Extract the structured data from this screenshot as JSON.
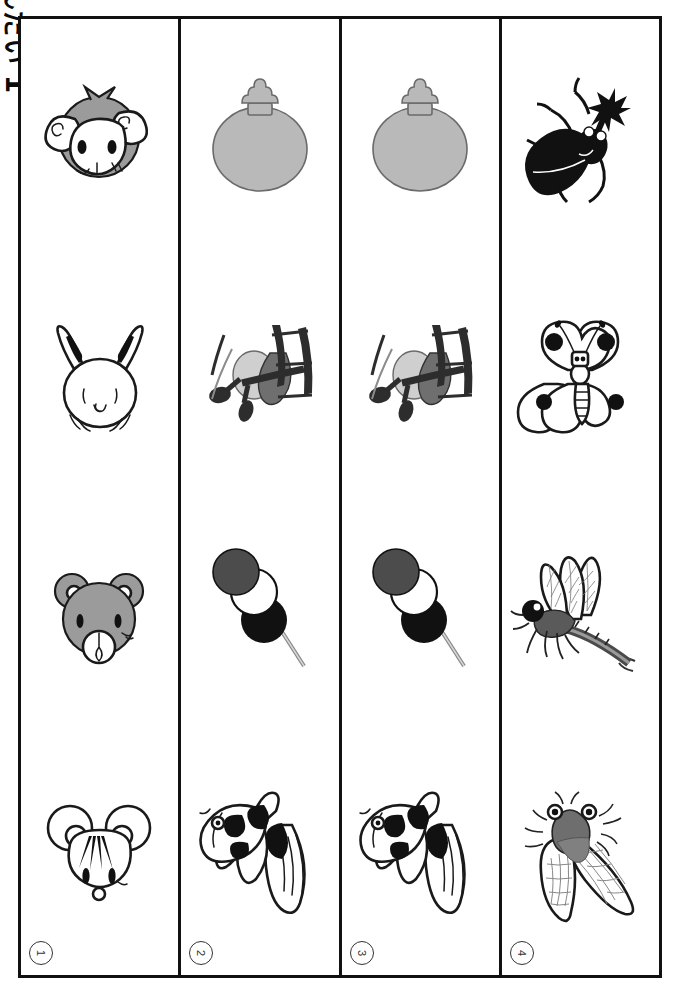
{
  "worksheet": {
    "title": "もんだい 1",
    "title_romaji": "mondai 1",
    "orientation": "rotated-90",
    "columns": 4,
    "rows": 4,
    "frame_color": "#111111",
    "background_color": "#ffffff"
  },
  "column_labels": [
    {
      "number": "1",
      "glyph": "①"
    },
    {
      "number": "2",
      "glyph": "②"
    },
    {
      "number": "3",
      "glyph": "③"
    },
    {
      "number": "4",
      "glyph": "④"
    }
  ],
  "grid": {
    "columns": [
      {
        "label": "①",
        "name": "column-1",
        "cells": [
          {
            "row": 1,
            "icon": "monkey-face-icon",
            "alt": "monkey face"
          },
          {
            "row": 2,
            "icon": "rabbit-face-icon",
            "alt": "rabbit face"
          },
          {
            "row": 3,
            "icon": "bear-face-icon",
            "alt": "bear face"
          },
          {
            "row": 4,
            "icon": "mouse-face-icon",
            "alt": "mouse face"
          }
        ]
      },
      {
        "label": "②",
        "name": "column-2",
        "cells": [
          {
            "row": 1,
            "icon": "uchiwa-fan-icon",
            "alt": "round paper fan"
          },
          {
            "row": 2,
            "icon": "biplane-icon",
            "alt": "biplane airplane"
          },
          {
            "row": 3,
            "icon": "dango-skewer-icon",
            "alt": "three dango on a skewer"
          },
          {
            "row": 4,
            "icon": "goldfish-icon",
            "alt": "goldfish"
          }
        ]
      },
      {
        "label": "③",
        "name": "column-3",
        "cells": [
          {
            "row": 1,
            "icon": "uchiwa-fan-icon",
            "alt": "round paper fan"
          },
          {
            "row": 2,
            "icon": "biplane-icon",
            "alt": "biplane airplane"
          },
          {
            "row": 3,
            "icon": "dango-skewer-icon",
            "alt": "three dango on a skewer"
          },
          {
            "row": 4,
            "icon": "goldfish-icon",
            "alt": "goldfish"
          }
        ]
      },
      {
        "label": "④",
        "name": "column-4",
        "cells": [
          {
            "row": 1,
            "icon": "rhinoceros-beetle-icon",
            "alt": "rhinoceros beetle"
          },
          {
            "row": 2,
            "icon": "butterfly-icon",
            "alt": "butterfly"
          },
          {
            "row": 3,
            "icon": "dragonfly-icon",
            "alt": "dragonfly"
          },
          {
            "row": 4,
            "icon": "cicada-icon",
            "alt": "cicada"
          }
        ]
      }
    ]
  },
  "colors": {
    "ink": "#111111",
    "mid_gray": "#9b9b9b",
    "light_gray": "#b9b9b9",
    "dark_gray": "#5e5e5e",
    "paper": "#ffffff"
  }
}
